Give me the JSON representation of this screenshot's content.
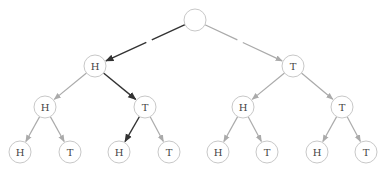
{
  "diagram": {
    "type": "probability-tree",
    "colors": {
      "highlight_edge": "#333333",
      "normal_edge": "#aaaaaa",
      "node_stroke": "#c8c8c8",
      "label": "#444444"
    },
    "node_radius": 11,
    "nodes": [
      {
        "id": "root",
        "label": "",
        "x": 195,
        "y": 20
      },
      {
        "id": "H",
        "label": "H",
        "x": 95,
        "y": 66
      },
      {
        "id": "T",
        "label": "T",
        "x": 293,
        "y": 66
      },
      {
        "id": "HH",
        "label": "H",
        "x": 45,
        "y": 107
      },
      {
        "id": "HT",
        "label": "T",
        "x": 145,
        "y": 107
      },
      {
        "id": "TH",
        "label": "H",
        "x": 243,
        "y": 107
      },
      {
        "id": "TT",
        "label": "T",
        "x": 342,
        "y": 107
      },
      {
        "id": "HHH",
        "label": "H",
        "x": 20,
        "y": 152
      },
      {
        "id": "HHT",
        "label": "T",
        "x": 70,
        "y": 152
      },
      {
        "id": "HTH",
        "label": "H",
        "x": 119,
        "y": 152
      },
      {
        "id": "HTT",
        "label": "T",
        "x": 169,
        "y": 152
      },
      {
        "id": "THH",
        "label": "H",
        "x": 218,
        "y": 152
      },
      {
        "id": "THT",
        "label": "T",
        "x": 267,
        "y": 152
      },
      {
        "id": "TTH",
        "label": "H",
        "x": 317,
        "y": 152
      },
      {
        "id": "TTT",
        "label": "T",
        "x": 366,
        "y": 152
      }
    ],
    "edges": [
      {
        "from": "root",
        "to": "H",
        "highlight": true,
        "gap": true
      },
      {
        "from": "root",
        "to": "T",
        "highlight": false,
        "gap": true
      },
      {
        "from": "H",
        "to": "HH",
        "highlight": false
      },
      {
        "from": "H",
        "to": "HT",
        "highlight": true
      },
      {
        "from": "T",
        "to": "TH",
        "highlight": false
      },
      {
        "from": "T",
        "to": "TT",
        "highlight": false
      },
      {
        "from": "HH",
        "to": "HHH",
        "highlight": false
      },
      {
        "from": "HH",
        "to": "HHT",
        "highlight": false
      },
      {
        "from": "HT",
        "to": "HTH",
        "highlight": true
      },
      {
        "from": "HT",
        "to": "HTT",
        "highlight": false
      },
      {
        "from": "TH",
        "to": "THH",
        "highlight": false
      },
      {
        "from": "TH",
        "to": "THT",
        "highlight": false
      },
      {
        "from": "TT",
        "to": "TTH",
        "highlight": false
      },
      {
        "from": "TT",
        "to": "TTT",
        "highlight": false
      }
    ]
  }
}
